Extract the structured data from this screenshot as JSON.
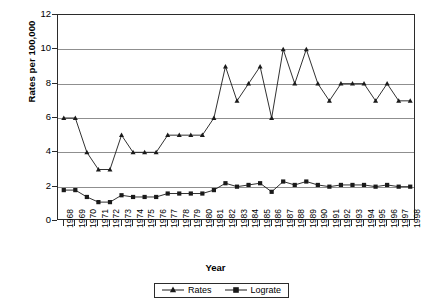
{
  "chart_data": {
    "type": "line",
    "title": "",
    "xlabel": "Year",
    "ylabel": "Rates per 100,000",
    "ylim": [
      0,
      12
    ],
    "ytick_labels": [
      "0",
      "2",
      "4",
      "6",
      "8",
      "10",
      "12"
    ],
    "ytick_values": [
      0,
      2,
      4,
      6,
      8,
      10,
      12
    ],
    "grid": true,
    "legend_position": "bottom-center",
    "categories": [
      "1968",
      "1969",
      "1970",
      "1971",
      "1972",
      "1973",
      "1974",
      "1975",
      "1976",
      "1977",
      "1978",
      "1979",
      "1980",
      "1981",
      "1982",
      "1983",
      "1984",
      "1985",
      "1986",
      "1987",
      "1988",
      "1989",
      "1990",
      "1991",
      "1992",
      "1993",
      "1994",
      "1995",
      "1996",
      "1997",
      "1998"
    ],
    "series": [
      {
        "name": "Rates",
        "marker": "triangle",
        "color": "#1a1a1a",
        "values": [
          6.0,
          6.0,
          4.0,
          3.0,
          3.0,
          5.0,
          4.0,
          4.0,
          4.0,
          5.0,
          5.0,
          5.0,
          5.0,
          6.0,
          9.0,
          7.0,
          8.0,
          9.0,
          6.0,
          10.0,
          8.0,
          10.0,
          8.0,
          7.0,
          8.0,
          8.0,
          8.0,
          7.0,
          8.0,
          7.0,
          7.0
        ]
      },
      {
        "name": "Lograte",
        "marker": "square",
        "color": "#1a1a1a",
        "values": [
          1.8,
          1.8,
          1.4,
          1.1,
          1.1,
          1.5,
          1.4,
          1.4,
          1.4,
          1.6,
          1.6,
          1.6,
          1.6,
          1.8,
          2.2,
          2.0,
          2.1,
          2.2,
          1.7,
          2.3,
          2.1,
          2.3,
          2.1,
          2.0,
          2.1,
          2.1,
          2.1,
          2.0,
          2.1,
          2.0,
          2.0
        ]
      }
    ]
  },
  "legend": {
    "entries": [
      {
        "label": "Rates"
      },
      {
        "label": "Lograte"
      }
    ]
  },
  "axes": {
    "y_title": "Rates per 100,000",
    "x_title": "Year"
  }
}
